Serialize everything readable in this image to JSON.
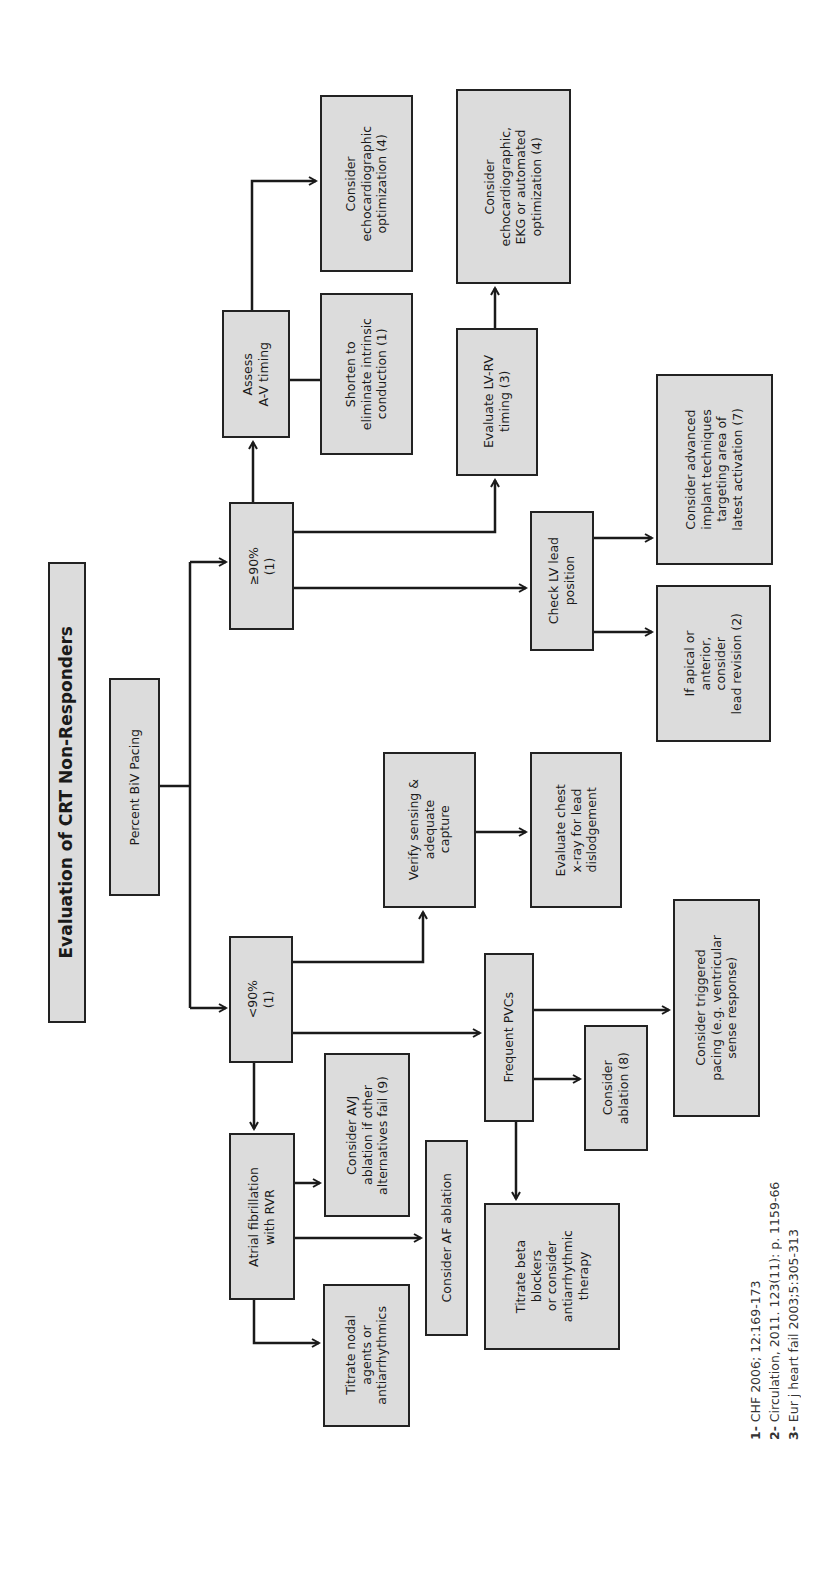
{
  "title": "Evaluation of CRT Non-Responders",
  "nodes": {
    "root": "Percent BiV Pacing",
    "high": "≥90%\n(1)",
    "low": "<90%\n(1)",
    "assess_av": "Assess\nA-V timing",
    "shorten": "Shorten  to\neliminate intrinsic\nconduction (1)",
    "echo_opt": "Consider\nechocardiographic\noptimization (4)",
    "lvrv": "Evaluate LV-RV\ntiming (3)",
    "echo_ekg": "Consider\nechocardiographic,\nEKG or automated\noptimization (4)",
    "check_lv": "Check LV lead\nposition",
    "advanced": "Consider advanced\nimplant techniques\ntargeting area of\nlatest activation (7)",
    "lead_revision": "If apical or\nanterior,\nconsider\nlead revision (2)",
    "verify": "Verify sensing &\nadequate\ncapture",
    "chest_xray": "Evaluate chest\nx-ray for lead\ndislodgement",
    "afib": "Atrial fibrillation\nwith RVR",
    "avj": "Consider AVJ\nablation if other\nalternatives fail (9)",
    "af_ablation": "Consider AF ablation",
    "titrate_nodal": "Titrate nodal\nagents or\nantiarrhythmics",
    "pvcs": "Frequent PVCs",
    "pvc_ablation": "Consider\nablation (8)",
    "titrate_beta": "Titrate beta\nblockers\nor consider\nantiarrhythmic\ntherapy",
    "triggered": "Consider triggered\npacing (e.g. ventricular\nsense response)"
  },
  "references": [
    {
      "num": "1-",
      "text": " CHF 2006; 12:169-173"
    },
    {
      "num": "2-",
      "text": " Circulation, 2011. 123(11): p. 1159-66"
    },
    {
      "num": "3-",
      "text": " Eur j heart fail 2003;5:305-313"
    }
  ],
  "colors": {
    "box_fill": "#dcdcdc",
    "box_border": "#222222",
    "line": "#1a1a1a"
  }
}
